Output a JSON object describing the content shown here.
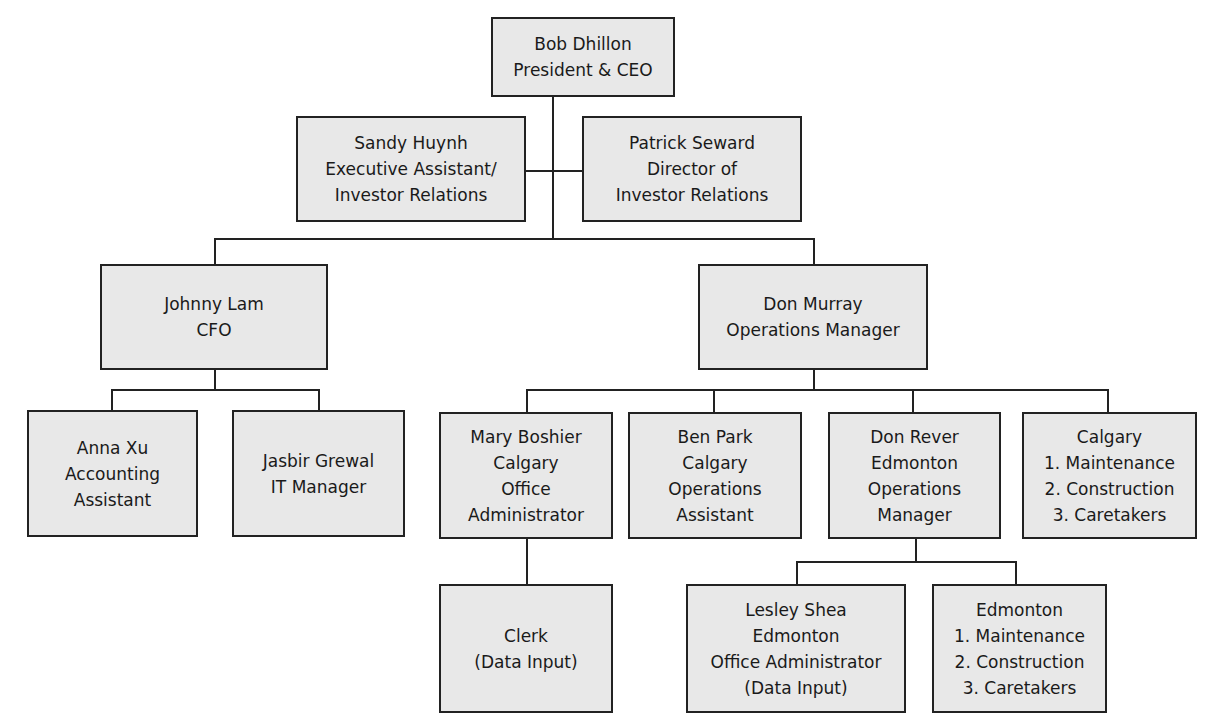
{
  "chart": {
    "nodes": {
      "ceo": {
        "name": "Bob Dhillon",
        "lines": [
          "Bob Dhillon",
          "President & CEO"
        ]
      },
      "sandy": {
        "name": "Sandy Huynh",
        "lines": [
          "Sandy Huynh",
          "Executive Assistant/",
          "Investor Relations"
        ]
      },
      "patrick": {
        "name": "Patrick Seward",
        "lines": [
          "Patrick Seward",
          "Director of",
          "Investor Relations"
        ]
      },
      "johnny": {
        "name": "Johnny Lam",
        "lines": [
          "Johnny Lam",
          "CFO"
        ]
      },
      "donmurray": {
        "name": "Don Murray",
        "lines": [
          "Don Murray",
          "Operations Manager"
        ]
      },
      "anna": {
        "name": "Anna Xu",
        "lines": [
          "Anna Xu",
          "Accounting",
          "Assistant"
        ]
      },
      "jasbir": {
        "name": "Jasbir Grewal",
        "lines": [
          "Jasbir Grewal",
          "IT Manager"
        ]
      },
      "mary": {
        "name": "Mary Boshier",
        "lines": [
          "Mary Boshier",
          "Calgary",
          "Office",
          "Administrator"
        ]
      },
      "ben": {
        "name": "Ben Park",
        "lines": [
          "Ben Park",
          "Calgary",
          "Operations",
          "Assistant"
        ]
      },
      "donrever": {
        "name": "Don Rever",
        "lines": [
          "Don Rever",
          "Edmonton",
          "Operations",
          "Manager"
        ]
      },
      "calgary": {
        "name": "Calgary",
        "lines": [
          "Calgary",
          "1. Maintenance",
          "2. Construction",
          "3. Caretakers"
        ]
      },
      "clerk": {
        "name": "Clerk",
        "lines": [
          "Clerk",
          "(Data Input)"
        ]
      },
      "lesley": {
        "name": "Lesley Shea",
        "lines": [
          "Lesley Shea",
          "Edmonton",
          "Office Administrator",
          "(Data Input)"
        ]
      },
      "edmonton": {
        "name": "Edmonton",
        "lines": [
          "Edmonton",
          "1. Maintenance",
          "2. Construction",
          "3. Caretakers"
        ]
      }
    },
    "edges": [
      [
        "ceo",
        "sandy"
      ],
      [
        "ceo",
        "patrick"
      ],
      [
        "ceo",
        "johnny"
      ],
      [
        "ceo",
        "donmurray"
      ],
      [
        "johnny",
        "anna"
      ],
      [
        "johnny",
        "jasbir"
      ],
      [
        "donmurray",
        "mary"
      ],
      [
        "donmurray",
        "ben"
      ],
      [
        "donmurray",
        "donrever"
      ],
      [
        "donmurray",
        "calgary"
      ],
      [
        "mary",
        "clerk"
      ],
      [
        "donrever",
        "lesley"
      ],
      [
        "donrever",
        "edmonton"
      ]
    ]
  }
}
